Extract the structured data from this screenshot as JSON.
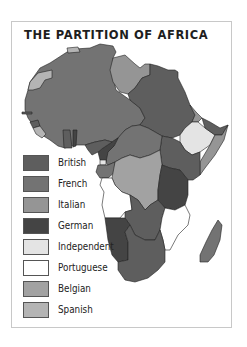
{
  "title": "THE PARTITION OF AFRICA",
  "legend": [
    {
      "label": "British",
      "color": "#5e5e5e"
    },
    {
      "label": "French",
      "color": "#737373"
    },
    {
      "label": "Italian",
      "color": "#959595"
    },
    {
      "label": "German",
      "color": "#444444"
    },
    {
      "label": "Independent",
      "color": "#e4e4e4"
    },
    {
      "label": "Portuguese",
      "color": "#ffffff"
    },
    {
      "label": "Belgian",
      "color": "#a2a2a2"
    },
    {
      "label": "Spanish",
      "color": "#b4b4b4"
    }
  ],
  "colors": {
    "british": "#5e5e5e",
    "french": "#737373",
    "italian": "#959595",
    "german": "#444444",
    "independent": "#e4e4e4",
    "portuguese": "#ffffff",
    "belgian": "#a2a2a2",
    "spanish": "#b4b4b4",
    "frame_border": "#c8c8c8"
  }
}
